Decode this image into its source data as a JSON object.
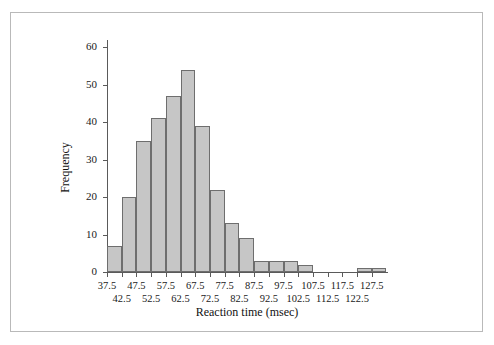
{
  "chart_data": {
    "type": "bar",
    "title": "",
    "xlabel": "Reaction time (msec)",
    "ylabel": "Frequency",
    "grid": false,
    "legend": null,
    "bin_width": 5,
    "xlim": [
      37.5,
      132.5
    ],
    "ylim": [
      0,
      62
    ],
    "categories": [
      "37.5-42.5",
      "42.5-47.5",
      "47.5-52.5",
      "52.5-57.5",
      "57.5-62.5",
      "62.5-67.5",
      "67.5-72.5",
      "72.5-77.5",
      "77.5-82.5",
      "82.5-87.5",
      "87.5-92.5",
      "92.5-97.5",
      "97.5-102.5",
      "102.5-107.5",
      "107.5-112.5",
      "112.5-117.5",
      "117.5-122.5",
      "122.5-127.5",
      "127.5-132.5"
    ],
    "bin_starts": [
      37.5,
      42.5,
      47.5,
      52.5,
      57.5,
      62.5,
      67.5,
      72.5,
      77.5,
      82.5,
      87.5,
      92.5,
      97.5,
      102.5,
      107.5,
      112.5,
      117.5,
      122.5,
      127.5
    ],
    "values": [
      7,
      20,
      35,
      41,
      47,
      54,
      39,
      22,
      13,
      9,
      3,
      3,
      3,
      2,
      0,
      0,
      0,
      1,
      1
    ],
    "xticks": [
      37.5,
      42.5,
      47.5,
      52.5,
      57.5,
      62.5,
      67.5,
      72.5,
      77.5,
      82.5,
      87.5,
      92.5,
      97.5,
      102.5,
      107.5,
      112.5,
      117.5,
      122.5,
      127.5
    ],
    "xtick_labels": [
      "37.5",
      "42.5",
      "47.5",
      "52.5",
      "57.5",
      "62.5",
      "67.5",
      "72.5",
      "77.5",
      "82.5",
      "87.5",
      "92.5",
      "97.5",
      "102.5",
      "107.5",
      "112.5",
      "117.5",
      "122.5",
      "127.5"
    ],
    "yticks": [
      0,
      10,
      20,
      30,
      40,
      50,
      60
    ],
    "ytick_labels": [
      "0",
      "10",
      "20",
      "30",
      "40",
      "50",
      "60"
    ],
    "bar_color": "#c6c6c6",
    "bar_edge_color": "#6e6e6e",
    "axis_color": "#5a5a5a",
    "frame_color": "#b9b9b9"
  }
}
